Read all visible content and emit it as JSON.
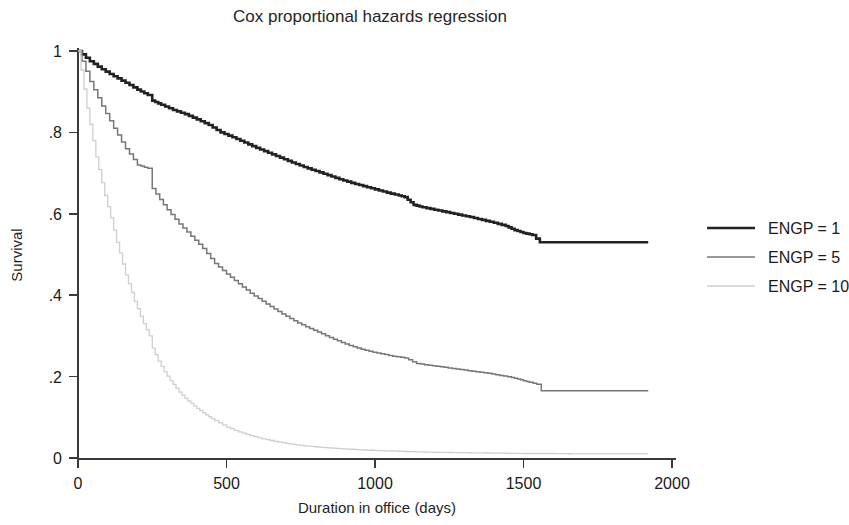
{
  "chart_data": {
    "type": "line",
    "title": "Cox proportional hazards regression",
    "xlabel": "Duration in office (days)",
    "ylabel": "Survival",
    "xlim": [
      0,
      2000
    ],
    "ylim": [
      0,
      1
    ],
    "xticks": [
      0,
      500,
      1000,
      1500,
      2000
    ],
    "xtick_labels": [
      "0",
      "500",
      "1000",
      "1500",
      "2000"
    ],
    "yticks": [
      0,
      0.2,
      0.4,
      0.6,
      0.8,
      1
    ],
    "ytick_labels": [
      "0",
      ".2",
      ".4",
      ".6",
      ".8",
      "1"
    ],
    "grid": false,
    "legend_position": "right",
    "series": [
      {
        "name": "ENGP = 1",
        "color": "#222222",
        "width": 2.6,
        "x": [
          0,
          40,
          80,
          120,
          160,
          200,
          235,
          250,
          280,
          320,
          360,
          400,
          440,
          480,
          520,
          560,
          600,
          640,
          680,
          720,
          760,
          800,
          840,
          880,
          920,
          960,
          1000,
          1040,
          1080,
          1100,
          1130,
          1160,
          1200,
          1240,
          1280,
          1320,
          1360,
          1400,
          1440,
          1470,
          1500,
          1530,
          1555,
          1560,
          1700,
          1800,
          1920
        ],
        "y": [
          1.0,
          0.975,
          0.955,
          0.938,
          0.922,
          0.905,
          0.892,
          0.878,
          0.868,
          0.855,
          0.845,
          0.832,
          0.818,
          0.8,
          0.788,
          0.775,
          0.762,
          0.75,
          0.738,
          0.726,
          0.715,
          0.705,
          0.695,
          0.685,
          0.676,
          0.668,
          0.66,
          0.652,
          0.645,
          0.641,
          0.622,
          0.616,
          0.61,
          0.604,
          0.598,
          0.592,
          0.585,
          0.578,
          0.57,
          0.56,
          0.553,
          0.548,
          0.53,
          0.53,
          0.53,
          0.53,
          0.53
        ]
      },
      {
        "name": "ENGP = 5",
        "color": "#777777",
        "width": 1.5,
        "x": [
          0,
          40,
          80,
          120,
          160,
          200,
          235,
          250,
          275,
          300,
          340,
          380,
          420,
          460,
          500,
          540,
          580,
          620,
          660,
          700,
          740,
          780,
          820,
          860,
          900,
          940,
          980,
          1020,
          1060,
          1100,
          1140,
          1180,
          1220,
          1260,
          1300,
          1340,
          1380,
          1420,
          1460,
          1490,
          1520,
          1545,
          1560,
          1700,
          1800,
          1920
        ],
        "y": [
          1.0,
          0.925,
          0.865,
          0.81,
          0.76,
          0.72,
          0.712,
          0.662,
          0.635,
          0.61,
          0.575,
          0.545,
          0.515,
          0.478,
          0.452,
          0.428,
          0.405,
          0.385,
          0.366,
          0.348,
          0.332,
          0.318,
          0.305,
          0.292,
          0.28,
          0.27,
          0.262,
          0.256,
          0.25,
          0.246,
          0.232,
          0.228,
          0.224,
          0.22,
          0.216,
          0.212,
          0.208,
          0.203,
          0.198,
          0.192,
          0.186,
          0.181,
          0.165,
          0.165,
          0.165,
          0.165
        ]
      },
      {
        "name": "ENGP = 10",
        "color": "#cfcfcf",
        "width": 1.3,
        "x": [
          0,
          30,
          60,
          90,
          110,
          130,
          160,
          190,
          220,
          240,
          250,
          270,
          290,
          310,
          340,
          370,
          400,
          430,
          460,
          500,
          540,
          580,
          620,
          660,
          700,
          760,
          820,
          880,
          950,
          1020,
          1100,
          1200,
          1300,
          1400,
          1500,
          1600,
          1700,
          1800,
          1920
        ],
        "y": [
          1.0,
          0.86,
          0.74,
          0.645,
          0.59,
          0.53,
          0.45,
          0.385,
          0.33,
          0.3,
          0.27,
          0.238,
          0.212,
          0.19,
          0.162,
          0.14,
          0.122,
          0.106,
          0.092,
          0.076,
          0.064,
          0.055,
          0.047,
          0.041,
          0.036,
          0.03,
          0.026,
          0.023,
          0.02,
          0.018,
          0.016,
          0.014,
          0.013,
          0.012,
          0.011,
          0.011,
          0.01,
          0.01,
          0.01
        ]
      }
    ]
  },
  "legend": {
    "entries": [
      {
        "label": "ENGP = 1"
      },
      {
        "label": "ENGP = 5"
      },
      {
        "label": "ENGP = 10"
      }
    ]
  }
}
